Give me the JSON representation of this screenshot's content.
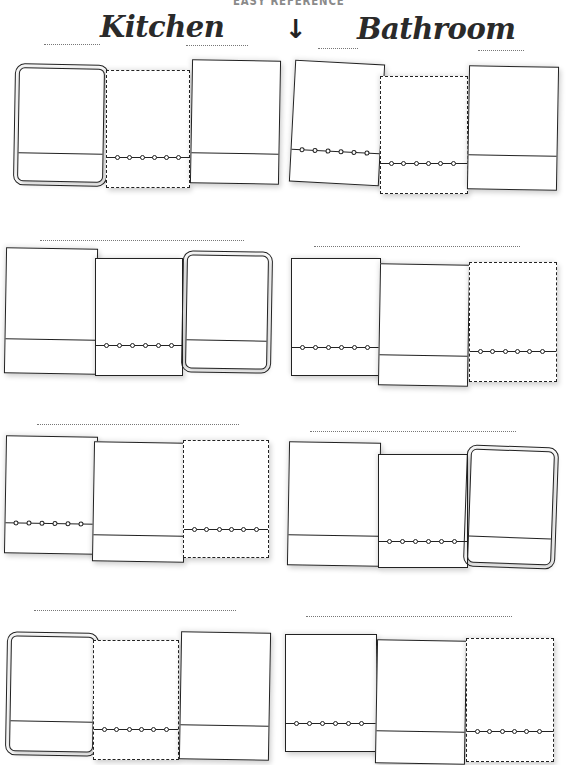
{
  "header": {
    "subtitle": "EASY REFERENCE",
    "arrow": "↓",
    "left_title": "Kitchen",
    "right_title": "Bathroom"
  },
  "sections": [
    {
      "side": "left",
      "row": 1,
      "label_line": ""
    },
    {
      "side": "right",
      "row": 1,
      "label_line": ""
    },
    {
      "side": "left",
      "row": 2,
      "label_line": ""
    },
    {
      "side": "right",
      "row": 2,
      "label_line": ""
    },
    {
      "side": "left",
      "row": 3,
      "label_line": ""
    },
    {
      "side": "right",
      "row": 3,
      "label_line": ""
    },
    {
      "side": "left",
      "row": 4,
      "label_line": ""
    },
    {
      "side": "right",
      "row": 4,
      "label_line": ""
    }
  ],
  "towel_styles": [
    "framed",
    "wavy-stitched",
    "plain-band",
    "plain-stitched"
  ],
  "colors": {
    "ink": "#222222",
    "subtitle": "#8a8a8a",
    "dotline": "#777777",
    "paper": "#ffffff"
  }
}
